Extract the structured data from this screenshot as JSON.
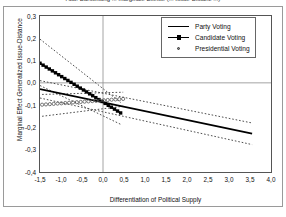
{
  "caption": "Abb. Darstellung ... marginale Effekte (... Issue-Distanz ...)",
  "chart_data": {
    "type": "line",
    "title": "",
    "xlabel": "Differentiation of Political Supply",
    "ylabel": "Marginal Effect Generalized Issue-Distance",
    "xlim": [
      -1.5,
      4.0
    ],
    "ylim": [
      -0.4,
      0.3
    ],
    "grid": true,
    "gridlines": {
      "horizontal_at": 0.0,
      "vertical_at": 0.0
    },
    "legend_position": "top-right",
    "decimal_separator": ",",
    "xticks": [
      "-1,5",
      "-1,0",
      "-0,5",
      "0,0",
      "0,5",
      "1,0",
      "1,5",
      "2,0",
      "2,5",
      "3,0",
      "3,5",
      "4,0"
    ],
    "xtick_values": [
      -1.5,
      -1.0,
      -0.5,
      0.0,
      0.5,
      1.0,
      1.5,
      2.0,
      2.5,
      3.0,
      3.5,
      4.0
    ],
    "yticks": [
      "0,3",
      "0,2",
      "0,1",
      "0,0",
      "-0,1",
      "-0,2",
      "-0,3",
      "-0,4"
    ],
    "ytick_values": [
      0.3,
      0.2,
      0.1,
      0.0,
      -0.1,
      -0.2,
      -0.3,
      -0.4
    ],
    "series": [
      {
        "name": "Party Voting",
        "style": "solid-line",
        "color": "#000000",
        "x": [
          -1.5,
          3.55
        ],
        "values": [
          -0.028,
          -0.228
        ],
        "ci_upper": [
          0.01,
          -0.18
        ],
        "ci_lower": [
          -0.068,
          -0.277
        ]
      },
      {
        "name": "Candidate Voting",
        "style": "line-with-square-markers",
        "color": "#000000",
        "x": [
          -1.5,
          0.42
        ],
        "values": [
          0.088,
          -0.135
        ],
        "ci_upper": [
          0.196,
          -0.088
        ],
        "ci_lower": [
          -0.012,
          -0.186
        ]
      },
      {
        "name": "Presidential Voting",
        "style": "open-circle-markers",
        "color": "#555555",
        "x": [
          -1.45,
          0.48
        ],
        "values": [
          -0.098,
          -0.072
        ],
        "ci_upper": [
          -0.052,
          -0.042
        ],
        "ci_lower": [
          -0.15,
          -0.105
        ]
      }
    ]
  },
  "legend": {
    "items": [
      {
        "label": "Party Voting",
        "symbol": "solid-line"
      },
      {
        "label": "Candidate Voting",
        "symbol": "line-square-marker"
      },
      {
        "label": "Presidential Voting",
        "symbol": "open-circle-marker"
      }
    ]
  }
}
